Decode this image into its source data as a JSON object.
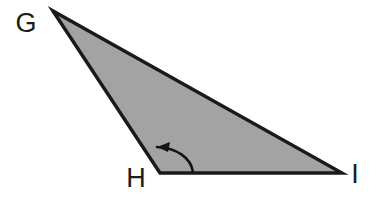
{
  "figure": {
    "kind": "geometry-diagram",
    "canvas": {
      "width": 378,
      "height": 201
    },
    "background_color": "#ffffff"
  },
  "shape": {
    "name": "triangle-ghi",
    "type": "triangle",
    "fill_color": "#a3a3a3",
    "stroke_color": "#1a1a1a",
    "stroke_width": 3.4,
    "polygon_points": "53,11 160,173 342,173",
    "vertices": [
      {
        "id": "G",
        "label": "G",
        "x": 53,
        "y": 11
      },
      {
        "id": "H",
        "label": "H",
        "x": 160,
        "y": 173
      },
      {
        "id": "I",
        "label": "I",
        "x": 342,
        "y": 173
      }
    ],
    "sides": [
      {
        "id": "GH",
        "from": "G",
        "to": "H"
      },
      {
        "id": "HI",
        "from": "H",
        "to": "I"
      },
      {
        "id": "IG",
        "from": "I",
        "to": "G"
      }
    ]
  },
  "labels": {
    "G": {
      "text": "G",
      "x": 26,
      "y": 32,
      "font_size": 27,
      "color": "#1c1c1c"
    },
    "H": {
      "text": "H",
      "x": 136,
      "y": 187,
      "font_size": 27,
      "color": "#1c1c1c"
    },
    "I": {
      "text": "I",
      "x": 355,
      "y": 183,
      "font_size": 27,
      "color": "#1c1c1c"
    }
  },
  "angle_marker": {
    "name": "angle-at-h",
    "at_vertex": "H",
    "arc_path": "M 193 172 C 191 158 177 148 157 147",
    "arrow_points": "157,147 170,142 168,152",
    "stroke_color": "#141414",
    "stroke_width": 2.6,
    "direction": "counterclockwise-toward-side-GH"
  }
}
